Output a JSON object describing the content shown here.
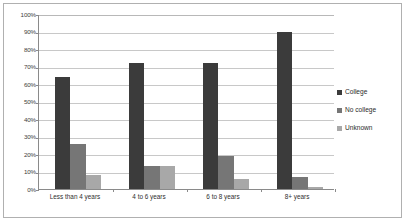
{
  "chart_data": {
    "type": "bar",
    "title": "",
    "subtitle": "",
    "xlabel": "",
    "ylabel": "",
    "categories": [
      "Less than 4 years",
      "4 to 6 years",
      "6 to 8 years",
      "8+ years"
    ],
    "series": [
      {
        "name": "College",
        "color": "#3b3b3b",
        "values": [
          64,
          72,
          72,
          90
        ]
      },
      {
        "name": "No college",
        "color": "#767676",
        "values": [
          26,
          13,
          19,
          7
        ]
      },
      {
        "name": "Unknown",
        "color": "#a8a8a8",
        "values": [
          8,
          13,
          6,
          1
        ]
      }
    ],
    "ylim": [
      0,
      100
    ],
    "ytick_values": [
      0,
      10,
      20,
      30,
      40,
      50,
      60,
      70,
      80,
      90,
      100
    ],
    "ytick_labels": [
      "0%",
      "10%",
      "20%",
      "30%",
      "40%",
      "50%",
      "60%",
      "70%",
      "80%",
      "90%",
      "100%"
    ],
    "grid": true,
    "grid_axis": "y",
    "legend_position": "right",
    "legend_entries": [
      "College",
      "No college",
      "Unknown"
    ],
    "annotations": []
  }
}
